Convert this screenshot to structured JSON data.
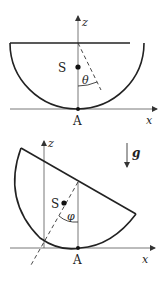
{
  "figure_top": {
    "axis_z_label": "z",
    "axis_x_label": "x",
    "center_label": "S",
    "angle_label": "θ",
    "contact_label": "A"
  },
  "figure_bottom": {
    "axis_z_label": "z",
    "axis_x_label": "x",
    "center_label": "S",
    "angle_label": "φ",
    "contact_label": "A",
    "gravity_label": "g"
  },
  "colors": {
    "stroke": "#222222",
    "thin_stroke": "#555555"
  }
}
